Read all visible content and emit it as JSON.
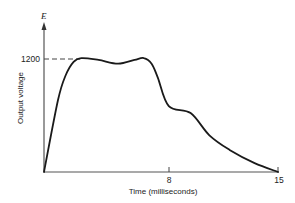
{
  "chart_data": {
    "type": "line",
    "title": "",
    "xlabel": "Time (milliseconds)",
    "ylabel": "Output voltage",
    "y_axis_symbol": "E",
    "xlim": [
      0,
      15
    ],
    "ylim": [
      0,
      1300
    ],
    "x_ticks": [
      8,
      15
    ],
    "x_tick_labels": [
      "8",
      "15"
    ],
    "y_ticks": [
      1200
    ],
    "y_tick_labels": [
      "1200"
    ],
    "grid": false,
    "legend": null,
    "annotations": [
      {
        "type": "dashed-reference-line",
        "y": 1200,
        "from_x": 0,
        "to_x": 2.4
      }
    ],
    "series": [
      {
        "name": "Output voltage",
        "x": [
          0,
          0.9,
          1.4,
          1.9,
          2.4,
          3.5,
          4.75,
          5.8,
          6.4,
          6.9,
          7.3,
          8.0,
          9.4,
          10.6,
          11.9,
          13.5,
          15
        ],
        "values": [
          0,
          765,
          1030,
          1170,
          1210,
          1190,
          1150,
          1190,
          1210,
          1150,
          1000,
          700,
          625,
          390,
          235,
          95,
          0
        ]
      }
    ]
  },
  "labels": {
    "y_symbol": "E",
    "y_tick_1200": "1200",
    "x_tick_8": "8",
    "x_tick_15": "15",
    "xlabel": "Time (milliseconds)",
    "ylabel": "Output voltage"
  }
}
